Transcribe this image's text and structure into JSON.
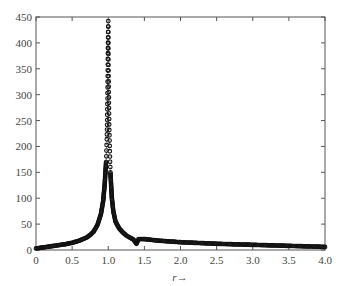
{
  "chart_data": {
    "type": "scatter",
    "title": "",
    "xlabel": "r→",
    "ylabel": "",
    "xlim": [
      0,
      4.0
    ],
    "ylim": [
      0,
      450
    ],
    "grid": false,
    "legend": null,
    "x_ticks": [
      "0",
      "0.5",
      "1.0",
      "1.5",
      "2.0",
      "2.5",
      "3.0",
      "3.5",
      "4.0"
    ],
    "y_ticks": [
      "0",
      "50",
      "100",
      "150",
      "200",
      "250",
      "300",
      "350",
      "400",
      "450"
    ],
    "marker": "open circle, dotted connecting line",
    "series": [
      {
        "name": "response",
        "x": [
          0.0,
          0.1,
          0.2,
          0.3,
          0.4,
          0.5,
          0.6,
          0.7,
          0.75,
          0.8,
          0.85,
          0.9,
          0.93,
          0.95,
          0.97,
          0.98,
          0.985,
          0.99,
          0.995,
          0.998,
          1.0,
          1.002,
          1.005,
          1.01,
          1.015,
          1.02,
          1.03,
          1.05,
          1.07,
          1.1,
          1.15,
          1.2,
          1.25,
          1.3,
          1.35,
          1.39,
          1.42,
          1.5,
          1.7,
          2.0,
          2.5,
          3.0,
          3.5,
          4.0
        ],
        "y": [
          3,
          5,
          7,
          9,
          11,
          14,
          18,
          24,
          29,
          36,
          48,
          70,
          95,
          125,
          170,
          214,
          251,
          303,
          380,
          421,
          442,
          400,
          336,
          274,
          232,
          201,
          150,
          100,
          75,
          55,
          42,
          34,
          28,
          24,
          20,
          12,
          21,
          21,
          18,
          15,
          12,
          10,
          8,
          6
        ]
      }
    ]
  }
}
